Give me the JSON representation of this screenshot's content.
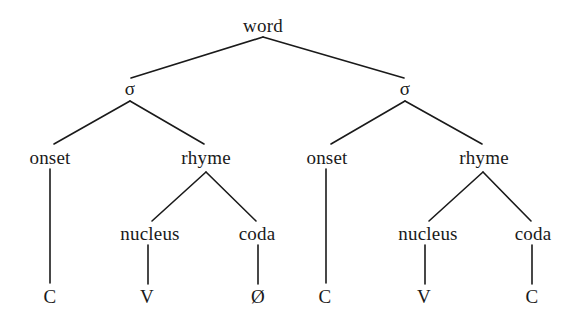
{
  "diagram": {
    "title": "word",
    "type": "syllable-structure-tree",
    "background_color": "#ffffff",
    "line_color": "#1a1a1a",
    "text_color": "#1a1a1a",
    "nodes": [
      {
        "id": "word",
        "label": "word",
        "x": 263,
        "y": 25,
        "level": "word"
      },
      {
        "id": "sigma1",
        "label": "σ",
        "x": 130,
        "y": 88,
        "level": "sigma"
      },
      {
        "id": "sigma2",
        "label": "σ",
        "x": 405,
        "y": 88,
        "level": "sigma"
      },
      {
        "id": "onset1",
        "label": "onset",
        "x": 50,
        "y": 157,
        "level": "constituent"
      },
      {
        "id": "rhyme1",
        "label": "rhyme",
        "x": 206,
        "y": 157,
        "level": "constituent"
      },
      {
        "id": "onset2",
        "label": "onset",
        "x": 327,
        "y": 157,
        "level": "constituent"
      },
      {
        "id": "rhyme2",
        "label": "rhyme",
        "x": 484,
        "y": 157,
        "level": "constituent"
      },
      {
        "id": "nucleus1",
        "label": "nucleus",
        "x": 150,
        "y": 233,
        "level": "subconstituent"
      },
      {
        "id": "coda1",
        "label": "coda",
        "x": 257,
        "y": 233,
        "level": "subconstituent"
      },
      {
        "id": "nucleus2",
        "label": "nucleus",
        "x": 428,
        "y": 233,
        "level": "subconstituent"
      },
      {
        "id": "coda2",
        "label": "coda",
        "x": 533,
        "y": 233,
        "level": "subconstituent"
      },
      {
        "id": "term-c1",
        "label": "C",
        "x": 50,
        "y": 296,
        "level": "terminal"
      },
      {
        "id": "term-v1",
        "label": "V",
        "x": 147,
        "y": 296,
        "level": "terminal"
      },
      {
        "id": "term-null",
        "label": "Ø",
        "x": 258,
        "y": 296,
        "level": "terminal"
      },
      {
        "id": "term-c2",
        "label": "C",
        "x": 325,
        "y": 296,
        "level": "terminal"
      },
      {
        "id": "term-v2",
        "label": "V",
        "x": 424,
        "y": 296,
        "level": "terminal"
      },
      {
        "id": "term-c3",
        "label": "C",
        "x": 532,
        "y": 296,
        "level": "terminal"
      }
    ],
    "edges": [
      {
        "id": "edge-word-sigma1",
        "from": "word",
        "to": "sigma1",
        "x1": 263,
        "y1": 37,
        "x2": 131,
        "y2": 78
      },
      {
        "id": "edge-word-sigma2",
        "from": "word",
        "to": "sigma2",
        "x1": 263,
        "y1": 37,
        "x2": 404,
        "y2": 78
      },
      {
        "id": "edge-sigma1-onset1",
        "from": "sigma1",
        "to": "onset1",
        "x1": 130,
        "y1": 101,
        "x2": 54,
        "y2": 144
      },
      {
        "id": "edge-sigma1-rhyme1",
        "from": "sigma1",
        "to": "rhyme1",
        "x1": 130,
        "y1": 101,
        "x2": 204,
        "y2": 144
      },
      {
        "id": "edge-sigma2-onset2",
        "from": "sigma2",
        "to": "onset2",
        "x1": 405,
        "y1": 101,
        "x2": 331,
        "y2": 144
      },
      {
        "id": "edge-sigma2-rhyme2",
        "from": "sigma2",
        "to": "rhyme2",
        "x1": 405,
        "y1": 101,
        "x2": 482,
        "y2": 144
      },
      {
        "id": "edge-onset1-c1",
        "from": "onset1",
        "to": "term-c1",
        "x1": 50,
        "y1": 169,
        "x2": 50,
        "y2": 283
      },
      {
        "id": "edge-onset2-c2",
        "from": "onset2",
        "to": "term-c2",
        "x1": 326,
        "y1": 169,
        "x2": 326,
        "y2": 283
      },
      {
        "id": "edge-rhyme1-nucleus1",
        "from": "rhyme1",
        "to": "nucleus1",
        "x1": 206,
        "y1": 172,
        "x2": 152,
        "y2": 221
      },
      {
        "id": "edge-rhyme1-coda1",
        "from": "rhyme1",
        "to": "coda1",
        "x1": 206,
        "y1": 172,
        "x2": 256,
        "y2": 221
      },
      {
        "id": "edge-rhyme2-nucleus2",
        "from": "rhyme2",
        "to": "nucleus2",
        "x1": 483,
        "y1": 172,
        "x2": 429,
        "y2": 221
      },
      {
        "id": "edge-rhyme2-coda2",
        "from": "rhyme2",
        "to": "coda2",
        "x1": 483,
        "y1": 172,
        "x2": 531,
        "y2": 221
      },
      {
        "id": "edge-nucleus1-v1",
        "from": "nucleus1",
        "to": "term-v1",
        "x1": 148,
        "y1": 245,
        "x2": 148,
        "y2": 284
      },
      {
        "id": "edge-coda1-null",
        "from": "coda1",
        "to": "term-null",
        "x1": 258,
        "y1": 245,
        "x2": 258,
        "y2": 284
      },
      {
        "id": "edge-nucleus2-v2",
        "from": "nucleus2",
        "to": "term-v2",
        "x1": 425,
        "y1": 245,
        "x2": 425,
        "y2": 284
      },
      {
        "id": "edge-coda2-c3",
        "from": "coda2",
        "to": "term-c3",
        "x1": 532,
        "y1": 245,
        "x2": 532,
        "y2": 284
      }
    ]
  }
}
